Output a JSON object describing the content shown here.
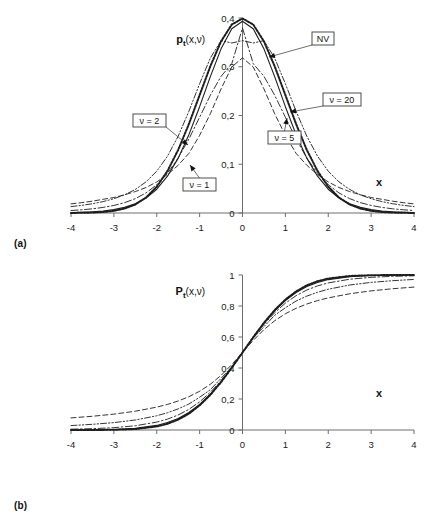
{
  "figure": {
    "panel_a_tag": "(a)",
    "panel_b_tag": "(b)"
  },
  "chart_data": [
    {
      "type": "line",
      "panel": "(a)",
      "title": "",
      "ylabel": "pt(x,ν)",
      "ylabel_main": "p",
      "ylabel_sub": "t",
      "ylabel_rest": "(x,ν)",
      "xlabel": "x",
      "xlim": [
        -4,
        4
      ],
      "ylim": [
        0,
        0.4
      ],
      "xticks": [
        "-4",
        "-3",
        "-2",
        "-1",
        "0",
        "1",
        "2",
        "3",
        "4"
      ],
      "xtick_values": [
        -4,
        -3,
        -2,
        -1,
        0,
        1,
        2,
        3,
        4
      ],
      "yticks": [
        "0",
        "0,1",
        "0,2",
        "0,3",
        "0,4"
      ],
      "ytick_values": [
        0,
        0.1,
        0.2,
        0.3,
        0.4
      ],
      "grid": false,
      "legend_position": "inline-callouts",
      "annotations": [
        {
          "label": "NV",
          "box_x": 312,
          "box_y": 32,
          "tip_x": 269,
          "tip_y": 57
        },
        {
          "label": "ν = 20",
          "box_x": 323,
          "box_y": 93,
          "tip_x": 290,
          "tip_y": 112
        },
        {
          "label": "ν = 5",
          "box_x": 268,
          "box_y": 131,
          "tip_x": 287,
          "tip_y": 118
        },
        {
          "label": "ν = 2",
          "box_x": 133,
          "box_y": 114,
          "tip_x": 188,
          "tip_y": 145
        },
        {
          "label": "ν = 1",
          "box_x": 183,
          "box_y": 178,
          "tip_x": 190,
          "tip_y": 165
        }
      ],
      "series": [
        {
          "name": "NV",
          "nu": null,
          "style": "dotted-thick",
          "x": [
            -4,
            -3.75,
            -3.5,
            -3.25,
            -3,
            -2.75,
            -2.5,
            -2.25,
            -2,
            -1.75,
            -1.5,
            -1.25,
            -1,
            -0.75,
            -0.5,
            -0.25,
            0,
            0.25,
            0.5,
            0.75,
            1,
            1.25,
            1.5,
            1.75,
            2,
            2.25,
            2.5,
            2.75,
            3,
            3.25,
            3.5,
            3.75,
            4
          ],
          "values": [
            0.0001,
            0.0004,
            0.0009,
            0.002,
            0.0044,
            0.0091,
            0.0175,
            0.0317,
            0.054,
            0.0863,
            0.1295,
            0.1826,
            0.242,
            0.3011,
            0.3521,
            0.3867,
            0.3989,
            0.3867,
            0.3521,
            0.3011,
            0.242,
            0.1826,
            0.1295,
            0.0863,
            0.054,
            0.0317,
            0.0175,
            0.0091,
            0.0044,
            0.002,
            0.0009,
            0.0004,
            0.0001
          ]
        },
        {
          "name": "ν = 20",
          "nu": 20,
          "style": "solid",
          "x": [
            -4,
            -3.75,
            -3.5,
            -3.25,
            -3,
            -2.75,
            -2.5,
            -2.25,
            -2,
            -1.75,
            -1.5,
            -1.25,
            -1,
            -0.75,
            -0.5,
            -0.25,
            0,
            0.25,
            0.5,
            0.75,
            1,
            1.25,
            1.5,
            1.75,
            2,
            2.25,
            2.5,
            2.75,
            3,
            3.25,
            3.5,
            3.75,
            4
          ],
          "values": [
            0.0008,
            0.0014,
            0.0024,
            0.0041,
            0.0069,
            0.0115,
            0.0189,
            0.0307,
            0.0488,
            0.0755,
            0.1126,
            0.1607,
            0.2181,
            0.2797,
            0.3367,
            0.3779,
            0.3933,
            0.3779,
            0.3367,
            0.2797,
            0.2181,
            0.1607,
            0.1126,
            0.0755,
            0.0488,
            0.0307,
            0.0189,
            0.0115,
            0.0069,
            0.0041,
            0.0024,
            0.0014,
            0.0008
          ]
        },
        {
          "name": "ν = 5",
          "nu": 5,
          "style": "dashdot",
          "x": [
            -4,
            -3.75,
            -3.5,
            -3.25,
            -3,
            -2.75,
            -2.5,
            -2.25,
            -2,
            -1.75,
            -1.5,
            -1.25,
            -1,
            -0.75,
            -0.5,
            -0.25,
            0,
            0.25,
            0.5,
            0.75,
            1,
            1.25,
            1.5,
            1.75,
            2,
            2.25,
            2.5,
            2.75,
            3,
            3.25,
            3.5,
            3.75,
            4
          ],
          "values": [
            0.0051,
            0.0066,
            0.0086,
            0.0115,
            0.0155,
            0.0212,
            0.0294,
            0.0412,
            0.058,
            0.0815,
            0.1128,
            0.1518,
            0.1964,
            0.2416,
            0.2804,
            0.3063,
            0.3796,
            0.3063,
            0.2804,
            0.2416,
            0.1964,
            0.1518,
            0.1128,
            0.0815,
            0.058,
            0.0412,
            0.0294,
            0.0212,
            0.0155,
            0.0115,
            0.0086,
            0.0066,
            0.0051
          ]
        },
        {
          "name": "ν = 2",
          "nu": 2,
          "style": "dashdotdot",
          "x": [
            -4,
            -3.75,
            -3.5,
            -3.25,
            -3,
            -2.75,
            -2.5,
            -2.25,
            -2,
            -1.75,
            -1.5,
            -1.25,
            -1,
            -0.75,
            -0.5,
            -0.25,
            0,
            0.25,
            0.5,
            0.75,
            1,
            1.25,
            1.5,
            1.75,
            2,
            2.25,
            2.5,
            2.75,
            3,
            3.25,
            3.5,
            3.75,
            4
          ],
          "values": [
            0.0131,
            0.0157,
            0.019,
            0.0234,
            0.0293,
            0.0372,
            0.0483,
            0.0638,
            0.0858,
            0.1165,
            0.1576,
            0.2087,
            0.2652,
            0.3179,
            0.3536,
            0.3487,
            0.3536,
            0.3487,
            0.3536,
            0.3179,
            0.2652,
            0.2087,
            0.1576,
            0.1165,
            0.0858,
            0.0638,
            0.0483,
            0.0372,
            0.0293,
            0.0234,
            0.019,
            0.0157,
            0.0131
          ]
        },
        {
          "name": "ν = 1",
          "nu": 1,
          "style": "dashed",
          "x": [
            -4,
            -3.75,
            -3.5,
            -3.25,
            -3,
            -2.75,
            -2.5,
            -2.25,
            -2,
            -1.75,
            -1.5,
            -1.25,
            -1,
            -0.75,
            -0.5,
            -0.25,
            0,
            0.25,
            0.5,
            0.75,
            1,
            1.25,
            1.5,
            1.75,
            2,
            2.25,
            2.5,
            2.75,
            3,
            3.25,
            3.5,
            3.75,
            4
          ],
          "values": [
            0.0187,
            0.0212,
            0.0243,
            0.0281,
            0.0318,
            0.0374,
            0.0439,
            0.0523,
            0.0637,
            0.0789,
            0.0979,
            0.1224,
            0.1592,
            0.2037,
            0.2546,
            0.2995,
            0.3183,
            0.2995,
            0.2546,
            0.2037,
            0.1592,
            0.1224,
            0.0979,
            0.0789,
            0.0637,
            0.0523,
            0.0439,
            0.0374,
            0.0318,
            0.0281,
            0.0243,
            0.0212,
            0.0187
          ]
        }
      ]
    },
    {
      "type": "line",
      "panel": "(b)",
      "title": "",
      "ylabel": "Pt(x,ν)",
      "ylabel_main": "P",
      "ylabel_sub": "t",
      "ylabel_rest": "(x,ν)",
      "xlabel": "x",
      "xlim": [
        -4,
        4
      ],
      "ylim": [
        0,
        1
      ],
      "xticks": [
        "-4",
        "-3",
        "-2",
        "-1",
        "0",
        "1",
        "2",
        "3",
        "4"
      ],
      "xtick_values": [
        -4,
        -3,
        -2,
        -1,
        0,
        1,
        2,
        3,
        4
      ],
      "yticks": [
        "0",
        "0,2",
        "0,4",
        "0,6",
        "0,8",
        "1"
      ],
      "ytick_values": [
        0,
        0.2,
        0.4,
        0.6,
        0.8,
        1
      ],
      "grid": false,
      "legend_position": "inline-callouts",
      "annotations": [
        {
          "label": "NV",
          "box_x": 264,
          "box_y": 272,
          "tip_x": 272,
          "tip_y": 300
        },
        {
          "label": "ν = 5",
          "box_x": 331,
          "box_y": 317,
          "tip_x": 324,
          "tip_y": 288
        },
        {
          "label": "ν = 2",
          "box_x": 300,
          "box_y": 333,
          "tip_x": 305,
          "tip_y": 303
        },
        {
          "label": "ν = 1",
          "box_x": 275,
          "box_y": 357,
          "tip_x": 283,
          "tip_y": 331
        },
        {
          "label": "ν = 20",
          "box_x": 142,
          "box_y": 409,
          "tip_x": 166,
          "tip_y": 456
        }
      ],
      "series": [
        {
          "name": "NV",
          "nu": null,
          "style": "dotted-thick",
          "x": [
            -4,
            -3.5,
            -3,
            -2.5,
            -2,
            -1.75,
            -1.5,
            -1.25,
            -1,
            -0.75,
            -0.5,
            -0.25,
            0,
            0.25,
            0.5,
            0.75,
            1,
            1.25,
            1.5,
            1.75,
            2,
            2.5,
            3,
            3.5,
            4
          ],
          "values": [
            3e-05,
            0.0002,
            0.0013,
            0.0062,
            0.0228,
            0.0401,
            0.0668,
            0.1056,
            0.1587,
            0.2266,
            0.3085,
            0.4013,
            0.5,
            0.5987,
            0.6915,
            0.7734,
            0.8413,
            0.8944,
            0.9332,
            0.9599,
            0.9772,
            0.9938,
            0.9987,
            0.9998,
            0.99997
          ]
        },
        {
          "name": "ν = 20",
          "nu": 20,
          "style": "solid",
          "x": [
            -4,
            -3.5,
            -3,
            -2.5,
            -2,
            -1.75,
            -1.5,
            -1.25,
            -1,
            -0.75,
            -0.5,
            -0.25,
            0,
            0.25,
            0.5,
            0.75,
            1,
            1.25,
            1.5,
            1.75,
            2,
            2.5,
            3,
            3.5,
            4
          ],
          "values": [
            0.0004,
            0.0011,
            0.0036,
            0.0106,
            0.0296,
            0.0479,
            0.0746,
            0.1128,
            0.1648,
            0.2311,
            0.3112,
            0.4026,
            0.5,
            0.5974,
            0.6888,
            0.7689,
            0.8352,
            0.8872,
            0.9254,
            0.9521,
            0.9704,
            0.9894,
            0.9964,
            0.9989,
            0.9996
          ]
        },
        {
          "name": "ν = 5",
          "nu": 5,
          "style": "dashdot",
          "x": [
            -4,
            -3.5,
            -3,
            -2.5,
            -2,
            -1.75,
            -1.5,
            -1.25,
            -1,
            -0.75,
            -0.5,
            -0.25,
            0,
            0.25,
            0.5,
            0.75,
            1,
            1.25,
            1.5,
            1.75,
            2,
            2.5,
            3,
            3.5,
            4
          ],
          "values": [
            0.0052,
            0.0086,
            0.015,
            0.0273,
            0.051,
            0.0702,
            0.097,
            0.1332,
            0.1816,
            0.2435,
            0.3191,
            0.4065,
            0.5,
            0.5935,
            0.6809,
            0.7565,
            0.8184,
            0.8668,
            0.903,
            0.9298,
            0.949,
            0.9727,
            0.985,
            0.9914,
            0.9948
          ]
        },
        {
          "name": "ν = 2",
          "nu": 2,
          "style": "dashdotdot",
          "x": [
            -4,
            -3.5,
            -3,
            -2.5,
            -2,
            -1.75,
            -1.5,
            -1.25,
            -1,
            -0.75,
            -0.5,
            -0.25,
            0,
            0.25,
            0.5,
            0.75,
            1,
            1.25,
            1.5,
            1.75,
            2,
            2.5,
            3,
            3.5,
            4
          ],
          "values": [
            0.0286,
            0.0367,
            0.0477,
            0.0645,
            0.0918,
            0.1114,
            0.1362,
            0.1678,
            0.2113,
            0.2599,
            0.3333,
            0.4082,
            0.5,
            0.5918,
            0.6667,
            0.7401,
            0.7887,
            0.8322,
            0.8638,
            0.8886,
            0.9082,
            0.9355,
            0.9523,
            0.9633,
            0.9714
          ]
        },
        {
          "name": "ν = 1",
          "nu": 1,
          "style": "dashed",
          "x": [
            -4,
            -3.5,
            -3,
            -2.5,
            -2,
            -1.75,
            -1.5,
            -1.25,
            -1,
            -0.75,
            -0.5,
            -0.25,
            0,
            0.25,
            0.5,
            0.75,
            1,
            1.25,
            1.5,
            1.75,
            2,
            2.5,
            3,
            3.5,
            4
          ],
          "values": [
            0.078,
            0.0886,
            0.1024,
            0.1211,
            0.1476,
            0.1651,
            0.1872,
            0.2148,
            0.25,
            0.2952,
            0.3524,
            0.422,
            0.5,
            0.578,
            0.6476,
            0.7048,
            0.75,
            0.7852,
            0.8128,
            0.8349,
            0.8524,
            0.8789,
            0.8976,
            0.9114,
            0.922
          ]
        }
      ]
    }
  ]
}
